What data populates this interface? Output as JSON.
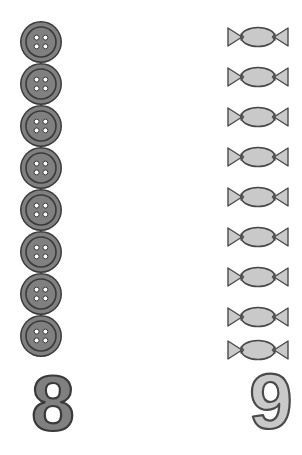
{
  "worksheet": {
    "type": "counting-worksheet",
    "background_color": "#ffffff",
    "groups": [
      {
        "name": "buttons-group",
        "object_name": "button",
        "object_icon": "button-icon",
        "count": 8,
        "numeral": "8",
        "numeral_style": "filled",
        "fill_color": "#808080",
        "outline_color": "#3a3a3a",
        "hole_color": "#ffffff",
        "items": [
          {
            "label": "button-1",
            "x": 19,
            "y": 20,
            "size": 44
          },
          {
            "label": "button-2",
            "x": 19,
            "y": 62,
            "size": 44
          },
          {
            "label": "button-3",
            "x": 19,
            "y": 104,
            "size": 44
          },
          {
            "label": "button-4",
            "x": 19,
            "y": 146,
            "size": 44
          },
          {
            "label": "button-5",
            "x": 19,
            "y": 188,
            "size": 44
          },
          {
            "label": "button-6",
            "x": 19,
            "y": 230,
            "size": 44
          },
          {
            "label": "button-7",
            "x": 19,
            "y": 272,
            "size": 44
          },
          {
            "label": "button-8",
            "x": 19,
            "y": 314,
            "size": 44
          }
        ],
        "numeral_position": {
          "x": 8,
          "y": 362
        }
      },
      {
        "name": "candies-group",
        "object_name": "candy",
        "object_icon": "wrapped-candy-icon",
        "count": 9,
        "numeral": "9",
        "numeral_style": "outlined",
        "fill_color": "#c9c9c9",
        "outline_color": "#4a4a4a",
        "items": [
          {
            "label": "candy-1",
            "x": 226,
            "y": 24,
            "width": 64,
            "height": 26
          },
          {
            "label": "candy-2",
            "x": 226,
            "y": 64,
            "width": 64,
            "height": 26
          },
          {
            "label": "candy-3",
            "x": 226,
            "y": 104,
            "width": 64,
            "height": 26
          },
          {
            "label": "candy-4",
            "x": 226,
            "y": 144,
            "width": 64,
            "height": 26
          },
          {
            "label": "candy-5",
            "x": 226,
            "y": 184,
            "width": 64,
            "height": 26
          },
          {
            "label": "candy-6",
            "x": 226,
            "y": 224,
            "width": 64,
            "height": 26
          },
          {
            "label": "candy-7",
            "x": 226,
            "y": 264,
            "width": 64,
            "height": 26
          },
          {
            "label": "candy-8",
            "x": 226,
            "y": 304,
            "width": 64,
            "height": 26
          },
          {
            "label": "candy-9",
            "x": 226,
            "y": 337,
            "width": 64,
            "height": 26
          }
        ],
        "numeral_position": {
          "x": 226,
          "y": 360
        }
      }
    ]
  }
}
